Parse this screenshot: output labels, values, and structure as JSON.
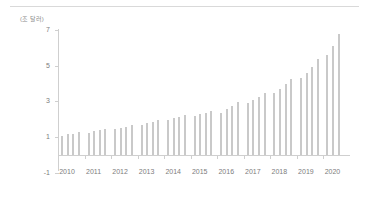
{
  "figure": {
    "unit_label": "(조 달러)",
    "background": "#ffffff",
    "bar_color": "#c9c9c9",
    "axis_color": "#cfcfcf",
    "text_color": "#7d7d7d"
  },
  "chart_data": {
    "type": "bar",
    "title": "",
    "subtitle": "",
    "xlabel": "",
    "ylabel": "(조 달러)",
    "unit": "조 달러",
    "grid": false,
    "legend": null,
    "ylim": [
      -1,
      7
    ],
    "ytick_labels": [
      "7",
      "5",
      "3",
      "1",
      "-1"
    ],
    "ytick_values": [
      7,
      5,
      3,
      1,
      -1
    ],
    "xtick_labels": [
      "2010",
      "2011",
      "2012",
      "2013",
      "2014",
      "2015",
      "2016",
      "2017",
      "2018",
      "2019",
      "2020"
    ],
    "xtick_values": [
      2010,
      2011,
      2012,
      2013,
      2014,
      2015,
      2016,
      2017,
      2018,
      2019,
      2020
    ],
    "frequency": "quarterly",
    "categories": [
      "2010Q1",
      "2010Q2",
      "2010Q3",
      "2010Q4",
      "2011Q1",
      "2011Q2",
      "2011Q3",
      "2011Q4",
      "2012Q1",
      "2012Q2",
      "2012Q3",
      "2012Q4",
      "2013Q1",
      "2013Q2",
      "2013Q3",
      "2013Q4",
      "2014Q1",
      "2014Q2",
      "2014Q3",
      "2014Q4",
      "2015Q1",
      "2015Q2",
      "2015Q3",
      "2015Q4",
      "2016Q1",
      "2016Q2",
      "2016Q3",
      "2016Q4",
      "2017Q1",
      "2017Q2",
      "2017Q3",
      "2017Q4",
      "2018Q1",
      "2018Q2",
      "2018Q3",
      "2018Q4",
      "2019Q1",
      "2019Q2",
      "2019Q3",
      "2019Q4",
      "2020Q1",
      "2020Q2",
      "2020Q3"
    ],
    "values": [
      1.05,
      1.15,
      1.2,
      1.3,
      1.25,
      1.32,
      1.38,
      1.48,
      1.45,
      1.52,
      1.58,
      1.7,
      1.68,
      1.78,
      1.85,
      1.95,
      1.95,
      2.05,
      2.12,
      2.25,
      2.2,
      2.3,
      2.35,
      2.48,
      2.35,
      2.6,
      2.75,
      2.95,
      2.9,
      3.1,
      3.25,
      3.5,
      3.45,
      3.7,
      3.95,
      4.25,
      4.3,
      4.6,
      4.95,
      5.35,
      5.6,
      6.1,
      6.8
    ]
  }
}
